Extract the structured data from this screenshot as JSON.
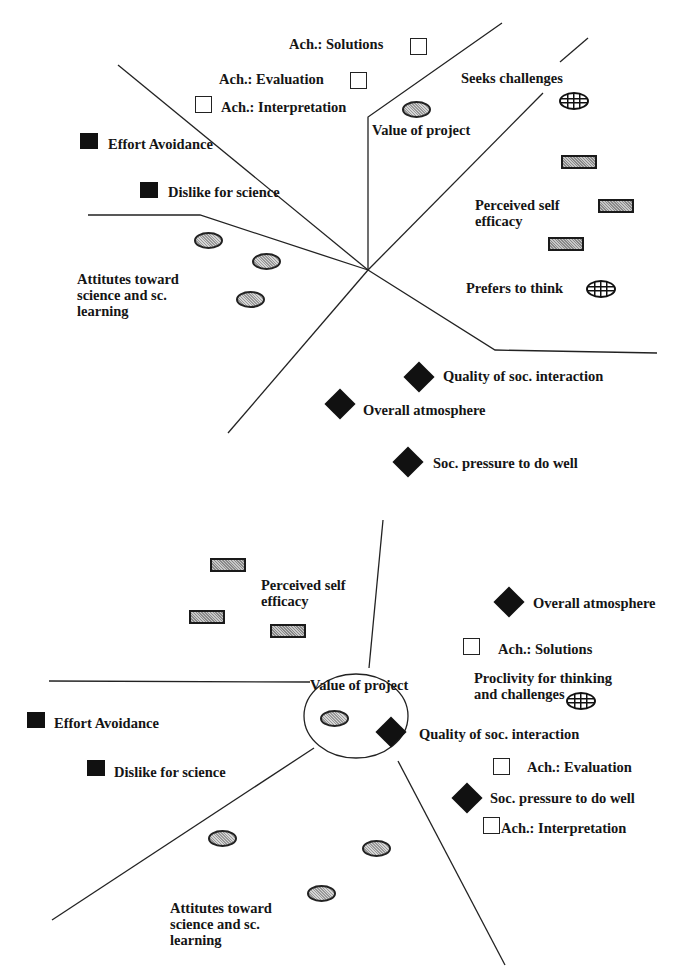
{
  "figure_top": {
    "labels": {
      "ach_solutions": "Ach.: Solutions",
      "ach_evaluation": "Ach.: Evaluation",
      "ach_interpretation": "Ach.: Interpretation",
      "seeks_challenges": "Seeks challenges",
      "value_of_project": "Value of project",
      "effort_avoidance": "Effort Avoidance",
      "dislike_for_science": "Dislike for science",
      "perceived_self_efficacy": "Perceived self\nefficacy",
      "attitudes": "Attitutes toward\nscience and sc.\nlearning",
      "prefers_to_think": "Prefers to think",
      "quality_soc_interaction": "Quality of soc. interaction",
      "overall_atmosphere": "Overall atmosphere",
      "soc_pressure": "Soc. pressure to do well"
    }
  },
  "figure_bottom": {
    "labels": {
      "perceived_self_efficacy": "Perceived self\nefficacy",
      "overall_atmosphere": "Overall atmosphere",
      "ach_solutions": "Ach.: Solutions",
      "proclivity": "Proclivity for thinking\nand challenges",
      "value_of_project": "Value of project",
      "effort_avoidance": "Effort Avoidance",
      "quality_soc_interaction": "Quality of soc. interaction",
      "ach_evaluation": "Ach.: Evaluation",
      "dislike_for_science": "Dislike for science",
      "soc_pressure": "Soc. pressure to do well",
      "ach_interpretation": "Ach.: Interpretation",
      "attitudes": "Attitutes toward\nscience and sc.\nlearning"
    }
  },
  "legend_symbols": {
    "open-square": "Achievement",
    "filled-square": "Negative motivation",
    "hatched-rectangle": "Self efficacy",
    "dotted-oval": "Attitudes / value",
    "filled-diamond": "Social climate",
    "globe": "Thinking / challenges"
  }
}
